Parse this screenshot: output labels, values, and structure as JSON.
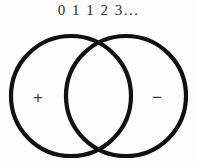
{
  "figure": {
    "title_text": "0 1 1 2 3...",
    "background_color": "#fdfdfd",
    "stroke_color": "#111111",
    "text_color": "#2b2b2b",
    "sign_color": "#3a3a3a"
  },
  "sequence": {
    "label": "0 1 1 2 3...",
    "terms": [
      "0",
      "1",
      "1",
      "2",
      "3",
      "..."
    ]
  },
  "venn": {
    "left_circle": {
      "sign": "+",
      "cx": 71,
      "cy": 96,
      "r": 60
    },
    "right_circle": {
      "sign": "−",
      "cx": 126,
      "cy": 96,
      "r": 60
    },
    "left_sign_x": 38,
    "left_sign_y": 97,
    "right_sign_x": 157,
    "right_sign_y": 97
  }
}
